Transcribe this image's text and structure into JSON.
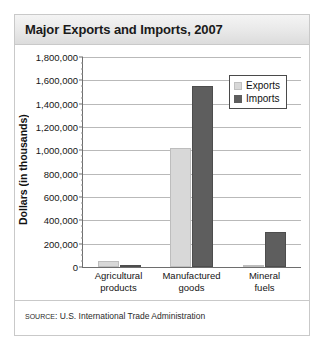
{
  "title": "Major Exports and Imports, 2007",
  "source": {
    "prefix": "SOURCE",
    "separator": ": ",
    "text": "U.S. International Trade Administration"
  },
  "colors": {
    "exports": "#d8d8d8",
    "imports": "#5e5e5e",
    "axis": "#6e6e6e",
    "gridline": "#b9b9b9",
    "title_band": "#e8e8e8",
    "frame": "#c9c9c9"
  },
  "chart_data": {
    "type": "bar",
    "title": "Major Exports and Imports, 2007",
    "xlabel": "",
    "ylabel": "Dollars (in thousands)",
    "categories": [
      "Agricultural products",
      "Manufactured goods",
      "Mineral fuels"
    ],
    "category_lines": [
      [
        "Agricultural",
        "products"
      ],
      [
        "Manufactured",
        "goods"
      ],
      [
        "Mineral",
        "fuels"
      ]
    ],
    "series": [
      {
        "name": "Exports",
        "color": "#d8d8d8",
        "values": [
          50000,
          1020000,
          10000
        ]
      },
      {
        "name": "Imports",
        "color": "#5e5e5e",
        "values": [
          20000,
          1550000,
          300000
        ]
      }
    ],
    "ylim": [
      0,
      1800000
    ],
    "ytick_step": 200000,
    "ytick_labels": [
      "0",
      "200,000",
      "400,000",
      "600,000",
      "800,000",
      "1,000,000",
      "1,200,000",
      "1,400,000",
      "1,600,000",
      "1,800,000"
    ],
    "ytick_values": [
      0,
      200000,
      400000,
      600000,
      800000,
      1000000,
      1200000,
      1400000,
      1600000,
      1800000
    ],
    "grid": true,
    "legend_position": "top-right",
    "legend": [
      "Exports",
      "Imports"
    ]
  }
}
